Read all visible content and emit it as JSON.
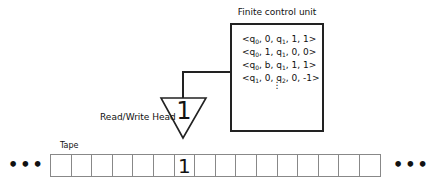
{
  "control_unit": {
    "label": "Finite control unit",
    "rules": [
      {
        "state": "q",
        "state_sub": "0",
        "read": "0",
        "next": "q",
        "next_sub": "1",
        "write": "1",
        "move": "1"
      },
      {
        "state": "q",
        "state_sub": "0",
        "read": "1",
        "next": "q",
        "next_sub": "1",
        "write": "0",
        "move": "0"
      },
      {
        "state": "q",
        "state_sub": "0",
        "read": "b",
        "next": "q",
        "next_sub": "1",
        "write": "1",
        "move": "1"
      },
      {
        "state": "q",
        "state_sub": "1",
        "read": "0",
        "next": "q",
        "next_sub": "2",
        "write": "0",
        "move": "-1"
      }
    ],
    "continuation": "⋮"
  },
  "head": {
    "label": "Read/Write Head",
    "symbol": "1"
  },
  "tape": {
    "label": "Tape",
    "cells": [
      "",
      "",
      "",
      "",
      "",
      "",
      "1",
      "",
      "",
      "",
      "",
      "",
      "",
      "",
      "",
      ""
    ],
    "ellipsis_left": "•••",
    "ellipsis_right": "•••"
  }
}
